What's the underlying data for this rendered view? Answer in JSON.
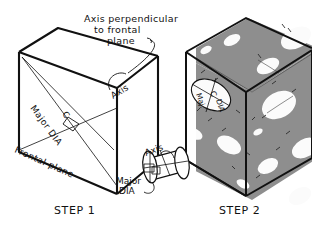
{
  "figure": {
    "title_visible": false,
    "background_color": "#ffffff",
    "ink_color": "#111111",
    "template_gray": "#8e8e8e",
    "hole_fill": "#fbfbfb"
  },
  "annotations": {
    "callout_axis_perp": {
      "line1": "Axis  perpendicular",
      "line2": "to  frontal",
      "line3": "plane"
    },
    "box_axis_label": "Axis",
    "major_dia_label": "Major  DIA",
    "center_mark": "C",
    "frontal_plane_label": "Frontal  plane",
    "cylinder_axis_label": "Axis",
    "cylinder_major_line1": "Major",
    "cylinder_major_line2": "DIA",
    "ellipse_template_major_line1": "Maj.",
    "ellipse_template_center": "C",
    "ellipse_template_major_line2": "DIA"
  },
  "steps": [
    {
      "id": "step-1",
      "label": "STEP  1"
    },
    {
      "id": "step-2",
      "label": "STEP  2"
    }
  ]
}
